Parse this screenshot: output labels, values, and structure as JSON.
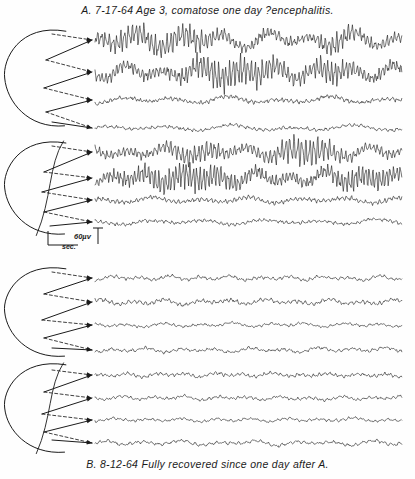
{
  "figure": {
    "type": "eeg-recording",
    "caption_top": "A. 7-17-64  Age 3, comatose one day ?encephalitis.",
    "caption_bottom": "B. 8-12-64  Fully recovered since one day after A.",
    "ink_color": "#1b1b1b",
    "paper_color": "#fefefe"
  },
  "calibration": {
    "time_label": "sec.",
    "amplitude_label": "60µv",
    "time_span_px": 30,
    "amplitude_span_px": 14
  },
  "chart_data": {
    "type": "line",
    "xlabel": "time (sec.)",
    "ylabel": "amplitude (µv)",
    "grid": false,
    "legend": "none",
    "trace_x_start": 95,
    "trace_x_end": 402,
    "blocks": [
      {
        "id": "A-upper",
        "record": "A",
        "montage": "lateral",
        "head_cx": 38,
        "head_cy": 78,
        "head_rx": 34,
        "head_ry": 52,
        "traces": [
          {
            "name": "A1-ch1",
            "baseline": 40,
            "amp": 9.0,
            "fast_amp": 6.0,
            "seed": 11,
            "slow_hz": 3.2,
            "fast_hz": 17.0,
            "burst": true
          },
          {
            "name": "A1-ch2",
            "baseline": 72,
            "amp": 8.0,
            "fast_amp": 6.5,
            "seed": 23,
            "slow_hz": 3.6,
            "fast_hz": 18.0,
            "burst": true
          },
          {
            "name": "A1-ch3",
            "baseline": 100,
            "amp": 4.0,
            "fast_amp": 2.0,
            "seed": 37,
            "slow_hz": 2.6,
            "fast_hz": 13.0,
            "burst": false
          },
          {
            "name": "A1-ch4",
            "baseline": 128,
            "amp": 3.2,
            "fast_amp": 1.5,
            "seed": 53,
            "slow_hz": 2.2,
            "fast_hz": 11.0,
            "burst": false
          }
        ],
        "arrows": [
          {
            "from_x": 52,
            "from_y": 34,
            "to_x": 92,
            "to_y": 40,
            "style": "dashed"
          },
          {
            "from_x": 46,
            "from_y": 60,
            "to_x": 92,
            "to_y": 40,
            "style": "solid"
          },
          {
            "from_x": 46,
            "from_y": 60,
            "to_x": 92,
            "to_y": 72,
            "style": "dashed"
          },
          {
            "from_x": 44,
            "from_y": 88,
            "to_x": 92,
            "to_y": 72,
            "style": "solid"
          },
          {
            "from_x": 44,
            "from_y": 88,
            "to_x": 92,
            "to_y": 100,
            "style": "dashed"
          },
          {
            "from_x": 46,
            "from_y": 112,
            "to_x": 92,
            "to_y": 100,
            "style": "solid"
          },
          {
            "from_x": 46,
            "from_y": 112,
            "to_x": 92,
            "to_y": 128,
            "style": "dashed"
          },
          {
            "from_x": 52,
            "from_y": 122,
            "to_x": 92,
            "to_y": 128,
            "style": "solid"
          }
        ]
      },
      {
        "id": "A-lower",
        "record": "A",
        "montage": "sagittal",
        "head_cx": 38,
        "head_cy": 188,
        "head_rx": 34,
        "head_ry": 50,
        "traces": [
          {
            "name": "A2-ch1",
            "baseline": 152,
            "amp": 6.0,
            "fast_amp": 5.0,
            "seed": 71,
            "slow_hz": 3.4,
            "fast_hz": 16.5,
            "burst": true
          },
          {
            "name": "A2-ch2",
            "baseline": 178,
            "amp": 7.0,
            "fast_amp": 6.0,
            "seed": 89,
            "slow_hz": 3.8,
            "fast_hz": 19.0,
            "burst": true
          },
          {
            "name": "A2-ch3",
            "baseline": 200,
            "amp": 3.4,
            "fast_amp": 2.2,
            "seed": 101,
            "slow_hz": 2.8,
            "fast_hz": 14.0,
            "burst": false
          },
          {
            "name": "A2-ch4",
            "baseline": 222,
            "amp": 3.0,
            "fast_amp": 1.6,
            "seed": 113,
            "slow_hz": 2.4,
            "fast_hz": 12.0,
            "burst": false
          }
        ],
        "arrows": [
          {
            "from_x": 52,
            "from_y": 146,
            "to_x": 92,
            "to_y": 152,
            "style": "dashed"
          },
          {
            "from_x": 44,
            "from_y": 172,
            "to_x": 92,
            "to_y": 152,
            "style": "solid"
          },
          {
            "from_x": 44,
            "from_y": 172,
            "to_x": 92,
            "to_y": 178,
            "style": "dashed"
          },
          {
            "from_x": 42,
            "from_y": 192,
            "to_x": 92,
            "to_y": 178,
            "style": "solid"
          },
          {
            "from_x": 42,
            "from_y": 192,
            "to_x": 92,
            "to_y": 200,
            "style": "dashed"
          },
          {
            "from_x": 44,
            "from_y": 212,
            "to_x": 92,
            "to_y": 200,
            "style": "solid"
          },
          {
            "from_x": 44,
            "from_y": 212,
            "to_x": 92,
            "to_y": 222,
            "style": "dashed"
          },
          {
            "from_x": 50,
            "from_y": 226,
            "to_x": 92,
            "to_y": 222,
            "style": "solid"
          }
        ]
      },
      {
        "id": "B-upper",
        "record": "B",
        "montage": "lateral",
        "head_cx": 38,
        "head_cy": 312,
        "head_rx": 34,
        "head_ry": 48,
        "traces": [
          {
            "name": "B1-ch1",
            "baseline": 278,
            "amp": 2.6,
            "fast_amp": 1.6,
            "seed": 131,
            "slow_hz": 4.6,
            "fast_hz": 10.5,
            "burst": false
          },
          {
            "name": "B1-ch2",
            "baseline": 302,
            "amp": 3.0,
            "fast_amp": 2.0,
            "seed": 149,
            "slow_hz": 4.2,
            "fast_hz": 11.5,
            "burst": false
          },
          {
            "name": "B1-ch3",
            "baseline": 325,
            "amp": 2.2,
            "fast_amp": 1.2,
            "seed": 163,
            "slow_hz": 3.8,
            "fast_hz": 10.0,
            "burst": false
          },
          {
            "name": "B1-ch4",
            "baseline": 350,
            "amp": 2.6,
            "fast_amp": 1.5,
            "seed": 181,
            "slow_hz": 4.0,
            "fast_hz": 9.5,
            "burst": false
          }
        ],
        "arrows": [
          {
            "from_x": 52,
            "from_y": 272,
            "to_x": 92,
            "to_y": 278,
            "style": "dashed"
          },
          {
            "from_x": 44,
            "from_y": 294,
            "to_x": 92,
            "to_y": 278,
            "style": "solid"
          },
          {
            "from_x": 44,
            "from_y": 294,
            "to_x": 92,
            "to_y": 302,
            "style": "dashed"
          },
          {
            "from_x": 42,
            "from_y": 320,
            "to_x": 92,
            "to_y": 302,
            "style": "solid"
          },
          {
            "from_x": 42,
            "from_y": 320,
            "to_x": 92,
            "to_y": 325,
            "style": "dashed"
          },
          {
            "from_x": 44,
            "from_y": 338,
            "to_x": 92,
            "to_y": 325,
            "style": "solid"
          },
          {
            "from_x": 44,
            "from_y": 338,
            "to_x": 92,
            "to_y": 350,
            "style": "dashed"
          },
          {
            "from_x": 52,
            "from_y": 348,
            "to_x": 92,
            "to_y": 350,
            "style": "solid"
          }
        ]
      },
      {
        "id": "B-lower",
        "record": "B",
        "montage": "sagittal",
        "head_cx": 38,
        "head_cy": 408,
        "head_rx": 34,
        "head_ry": 48,
        "traces": [
          {
            "name": "B2-ch1",
            "baseline": 375,
            "amp": 2.4,
            "fast_amp": 1.8,
            "seed": 197,
            "slow_hz": 4.8,
            "fast_hz": 12.0,
            "burst": false
          },
          {
            "name": "B2-ch2",
            "baseline": 398,
            "amp": 2.2,
            "fast_amp": 1.5,
            "seed": 211,
            "slow_hz": 4.4,
            "fast_hz": 11.0,
            "burst": false
          },
          {
            "name": "B2-ch3",
            "baseline": 420,
            "amp": 2.0,
            "fast_amp": 1.3,
            "seed": 227,
            "slow_hz": 4.0,
            "fast_hz": 10.0,
            "burst": false
          },
          {
            "name": "B2-ch4",
            "baseline": 443,
            "amp": 2.6,
            "fast_amp": 1.6,
            "seed": 241,
            "slow_hz": 3.6,
            "fast_hz": 9.0,
            "burst": false
          }
        ],
        "arrows": [
          {
            "from_x": 52,
            "from_y": 370,
            "to_x": 92,
            "to_y": 375,
            "style": "dashed"
          },
          {
            "from_x": 44,
            "from_y": 392,
            "to_x": 92,
            "to_y": 375,
            "style": "solid"
          },
          {
            "from_x": 44,
            "from_y": 392,
            "to_x": 92,
            "to_y": 398,
            "style": "dashed"
          },
          {
            "from_x": 42,
            "from_y": 414,
            "to_x": 92,
            "to_y": 398,
            "style": "solid"
          },
          {
            "from_x": 42,
            "from_y": 414,
            "to_x": 92,
            "to_y": 420,
            "style": "dashed"
          },
          {
            "from_x": 44,
            "from_y": 432,
            "to_x": 92,
            "to_y": 420,
            "style": "solid"
          },
          {
            "from_x": 44,
            "from_y": 432,
            "to_x": 92,
            "to_y": 443,
            "style": "dashed"
          },
          {
            "from_x": 52,
            "from_y": 440,
            "to_x": 92,
            "to_y": 443,
            "style": "solid"
          }
        ]
      }
    ]
  }
}
